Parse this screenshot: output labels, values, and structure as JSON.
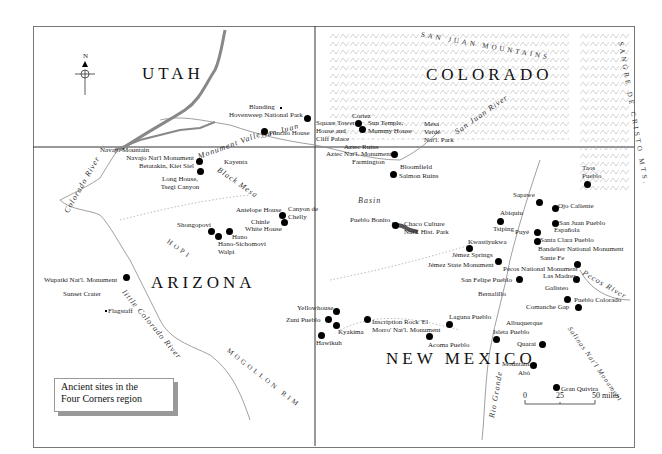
{
  "title": {
    "line1": "Ancient sites in the",
    "line2": "Four Corners region"
  },
  "compass": {
    "label": "N"
  },
  "states": [
    "UTAH",
    "COLORADO",
    "ARIZONA",
    "NEW MEXICO"
  ],
  "ranges": [
    "SAN JUAN MOUNTAINS",
    "SANGRE DE CRISTO MTS.",
    "MOGOLLON RIM",
    "HOPI"
  ],
  "rivers": [
    "Colorado River",
    "San Juan",
    "San Juan River",
    "Rio Grande",
    "Pecos River",
    "little Colorado River",
    "Black Mesa",
    "Monument Valley",
    "Basin"
  ],
  "sites": [
    {
      "name": "Blanding",
      "type": "town"
    },
    {
      "name": "Hovenweep National Park",
      "type": "site"
    },
    {
      "name": "Poncho House",
      "type": "site"
    },
    {
      "name": "Cortez",
      "type": "town"
    },
    {
      "name": "Square Tower House and Cliff Palace",
      "type": "site"
    },
    {
      "name": "Sun Temple, Mummy House",
      "type": "site"
    },
    {
      "name": "Mesa Verde Nat'l. Park",
      "type": "label"
    },
    {
      "name": "Aztec Ruins",
      "type": "label"
    },
    {
      "name": "Aztec Nat'l. Monument",
      "type": "site"
    },
    {
      "name": "Farmington",
      "type": "town"
    },
    {
      "name": "Bloomfield",
      "type": "town"
    },
    {
      "name": "Salmon Ruins",
      "type": "site"
    },
    {
      "name": "Navajo Mountain",
      "type": "label"
    },
    {
      "name": "Navajo Nat'l Monument Betatakin, Kiet Siel",
      "type": "site"
    },
    {
      "name": "Long House, Tsegi Canyon",
      "type": "site"
    },
    {
      "name": "Kayenta",
      "type": "town"
    },
    {
      "name": "Antelope House",
      "type": "site"
    },
    {
      "name": "Canyon de Chelly",
      "type": "label"
    },
    {
      "name": "Chinle",
      "type": "town"
    },
    {
      "name": "White House",
      "type": "site"
    },
    {
      "name": "Shongopovi",
      "type": "site"
    },
    {
      "name": "Hano",
      "type": "site"
    },
    {
      "name": "Hano-Sichomovi Walpi",
      "type": "site"
    },
    {
      "name": "Wupatki Nat'l. Monument",
      "type": "site"
    },
    {
      "name": "Sunset Crater",
      "type": "label"
    },
    {
      "name": "Flagstaff",
      "type": "town"
    },
    {
      "name": "Pueblo Bonito",
      "type": "site"
    },
    {
      "name": "Chaco Culture Nat'l. Hist. Park",
      "type": "label"
    },
    {
      "name": "Kwastiyukwa",
      "type": "site"
    },
    {
      "name": "Jémez Springs",
      "type": "town"
    },
    {
      "name": "Jémez State Monument",
      "type": "site"
    },
    {
      "name": "San Felipe Pueblo",
      "type": "site"
    },
    {
      "name": "Bernalillo",
      "type": "town"
    },
    {
      "name": "Taos Pueblo",
      "type": "site"
    },
    {
      "name": "Sapawe",
      "type": "site"
    },
    {
      "name": "Ojo Caliente",
      "type": "site"
    },
    {
      "name": "Abiquiu",
      "type": "town"
    },
    {
      "name": "Tsiping",
      "type": "site"
    },
    {
      "name": "Puyé",
      "type": "site"
    },
    {
      "name": "San Juan Pueblo",
      "type": "site"
    },
    {
      "name": "Española",
      "type": "town"
    },
    {
      "name": "Santa Clara Pueblo",
      "type": "site"
    },
    {
      "name": "Bandelier National Monument",
      "type": "label"
    },
    {
      "name": "Sante Fe",
      "type": "town"
    },
    {
      "name": "Pecos National Monument",
      "type": "site"
    },
    {
      "name": "Las Madres",
      "type": "site"
    },
    {
      "name": "Galisteo",
      "type": "town"
    },
    {
      "name": "Pueblo Colorado",
      "type": "site"
    },
    {
      "name": "Comanche Gap",
      "type": "site"
    },
    {
      "name": "Yellowhouse",
      "type": "site"
    },
    {
      "name": "Zuni Pueblo",
      "type": "site"
    },
    {
      "name": "Kyakima",
      "type": "site"
    },
    {
      "name": "Hawikuh",
      "type": "site"
    },
    {
      "name": "Inscription Rock 'El Morro' Nat'l. Monument",
      "type": "site"
    },
    {
      "name": "Acoma Pueblo",
      "type": "site"
    },
    {
      "name": "Laguna Pueblo",
      "type": "site"
    },
    {
      "name": "Albuquerque",
      "type": "town"
    },
    {
      "name": "Isleta Pueblo",
      "type": "site"
    },
    {
      "name": "Quarai",
      "type": "site"
    },
    {
      "name": "Mountainair",
      "type": "town"
    },
    {
      "name": "Abó",
      "type": "site"
    },
    {
      "name": "Salinas Nat'l Monument",
      "type": "label"
    },
    {
      "name": "Gran Quivira",
      "type": "site"
    }
  ],
  "scale": {
    "ticks": [
      "0",
      "25",
      "50 miles"
    ]
  }
}
